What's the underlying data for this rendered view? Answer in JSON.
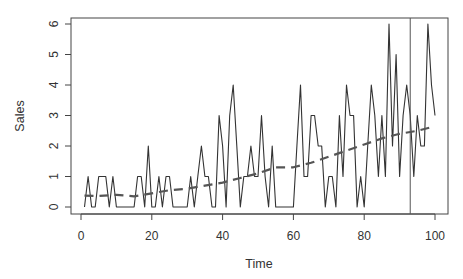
{
  "chart_data": {
    "type": "line",
    "title": "",
    "xlabel": "Time",
    "ylabel": "Sales",
    "xlim": [
      0,
      100
    ],
    "ylim": [
      0,
      6
    ],
    "x_ticks": [
      0,
      20,
      40,
      60,
      80,
      100
    ],
    "y_ticks": [
      0,
      1,
      2,
      3,
      4,
      5,
      6
    ],
    "grid": false,
    "legend": null,
    "series": [
      {
        "name": "Sales",
        "style": "solid",
        "color": "#333333",
        "x": [
          1,
          2,
          3,
          4,
          5,
          6,
          7,
          8,
          9,
          10,
          11,
          12,
          13,
          14,
          15,
          16,
          17,
          18,
          19,
          20,
          21,
          22,
          23,
          24,
          25,
          26,
          27,
          28,
          29,
          30,
          31,
          32,
          33,
          34,
          35,
          36,
          37,
          38,
          39,
          40,
          41,
          42,
          43,
          44,
          45,
          46,
          47,
          48,
          49,
          50,
          51,
          52,
          53,
          54,
          55,
          56,
          57,
          58,
          59,
          60,
          61,
          62,
          63,
          64,
          65,
          66,
          67,
          68,
          69,
          70,
          71,
          72,
          73,
          74,
          75,
          76,
          77,
          78,
          79,
          80,
          81,
          82,
          83,
          84,
          85,
          86,
          87,
          88,
          89,
          90,
          91,
          92,
          93,
          94,
          95,
          96,
          97,
          98,
          99,
          100
        ],
        "values": [
          0,
          1,
          0,
          0,
          1,
          1,
          1,
          0,
          1,
          0,
          0,
          0,
          0,
          0,
          0,
          1,
          1,
          0,
          2,
          0,
          0,
          1,
          0,
          1,
          1,
          0,
          0,
          0,
          0,
          0,
          1,
          0,
          1,
          2,
          1,
          1,
          0,
          0,
          3,
          2,
          0,
          3,
          4,
          2,
          0,
          1,
          1,
          2,
          1,
          1,
          3,
          1,
          0,
          2,
          0,
          0,
          0,
          0,
          0,
          0,
          2,
          4,
          1,
          1,
          3,
          3,
          2,
          2,
          0,
          1,
          1,
          0,
          3,
          1,
          4,
          3,
          3,
          0,
          1,
          0,
          2,
          4,
          3,
          1,
          3,
          1,
          6,
          2,
          5,
          1,
          3,
          4,
          3,
          1,
          3,
          2,
          2,
          6,
          4,
          3
        ]
      },
      {
        "name": "Trend",
        "style": "dashed",
        "color": "#555555",
        "x": [
          1,
          5,
          10,
          15,
          20,
          25,
          30,
          35,
          40,
          45,
          50,
          55,
          60,
          65,
          70,
          75,
          80,
          85,
          90,
          95,
          100
        ],
        "values": [
          0.37,
          0.36,
          0.4,
          0.35,
          0.45,
          0.55,
          0.6,
          0.7,
          0.8,
          0.95,
          1.1,
          1.3,
          1.3,
          1.45,
          1.65,
          1.85,
          2.05,
          2.25,
          2.4,
          2.5,
          2.65
        ]
      }
    ],
    "annotations": [
      {
        "type": "vline",
        "x": 93,
        "color": "#555555",
        "label": ""
      }
    ]
  },
  "axes": {
    "x_tick_labels": [
      "0",
      "20",
      "40",
      "60",
      "80",
      "100"
    ],
    "y_tick_labels": [
      "0",
      "1",
      "2",
      "3",
      "4",
      "5",
      "6"
    ],
    "x_title": "Time",
    "y_title": "Sales"
  }
}
